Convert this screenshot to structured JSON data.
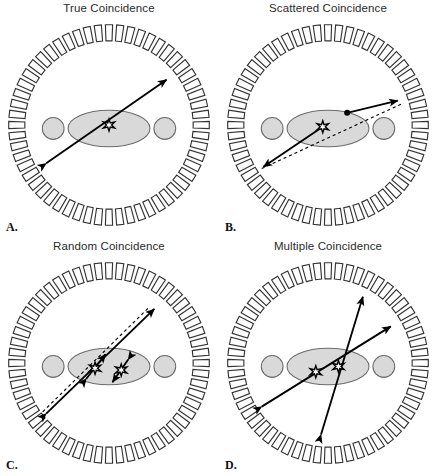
{
  "figure": {
    "caption_letters": [
      "A.",
      "B.",
      "C.",
      "D."
    ],
    "background_color": "#ffffff",
    "line_color": "#000000",
    "phantom_fill": "#d9d9d9",
    "phantom_stroke": "#6b6b6b",
    "detector_fill": "#ffffff",
    "detector_stroke": "#333333"
  },
  "panels": [
    {
      "id": "A",
      "letter": "A.",
      "title": "True Coincidence",
      "description": "Both 511 keV photons from a single annihilation travel undeviated and are detected in opposite detector blocks.",
      "events": [
        {
          "kind": "true",
          "source_star": {
            "x": 0.0,
            "y": 0.0
          },
          "lines": [
            {
              "style": "solid",
              "arrows": "both",
              "x1": -0.72,
              "y1": 0.44,
              "x2": 0.66,
              "y2": -0.52
            }
          ]
        }
      ]
    },
    {
      "id": "B",
      "letter": "B.",
      "title": "Scattered Coincidence",
      "description": "One photon undergoes Compton scatter inside the phantom; the assigned line of response (dotted) is displaced from the true annihilation site.",
      "events": [
        {
          "kind": "scattered",
          "source_star": {
            "x": -0.06,
            "y": 0.02
          },
          "scatter_point": {
            "x": 0.22,
            "y": -0.14
          },
          "lines": [
            {
              "style": "solid",
              "arrows": "end",
              "x1": -0.06,
              "y1": 0.02,
              "x2": -0.74,
              "y2": 0.48
            },
            {
              "style": "solid",
              "arrows": "end",
              "x1": 0.22,
              "y1": -0.14,
              "x2": 0.8,
              "y2": -0.28
            },
            {
              "style": "dotted",
              "arrows": "none",
              "x1": -0.76,
              "y1": 0.5,
              "x2": 0.84,
              "y2": -0.24
            }
          ]
        }
      ]
    },
    {
      "id": "C",
      "letter": "C.",
      "title": "Random Coincidence",
      "description": "Photons from two unrelated annihilations are recorded within the coincidence window; the assigned line of response (dotted) corresponds to neither true event.",
      "events": [
        {
          "kind": "random",
          "source_star": {
            "x": -0.16,
            "y": 0.06
          },
          "lines": [
            {
              "style": "solid",
              "arrows": "both",
              "x1": -0.26,
              "y1": 0.18,
              "x2": -0.04,
              "y2": -0.1
            },
            {
              "style": "solid",
              "arrows": "both",
              "x1": -0.72,
              "y1": 0.58,
              "x2": 0.52,
              "y2": -0.62
            }
          ]
        },
        {
          "kind": "random",
          "source_star": {
            "x": 0.14,
            "y": 0.08
          },
          "lines": [
            {
              "style": "solid",
              "arrows": "both",
              "x1": 0.22,
              "y1": -0.04,
              "x2": 0.04,
              "y2": 0.22
            },
            {
              "style": "dotted",
              "arrows": "none",
              "x1": -0.76,
              "y1": 0.56,
              "x2": 0.46,
              "y2": -0.64
            }
          ]
        }
      ]
    },
    {
      "id": "D",
      "letter": "D.",
      "title": "Multiple Coincidence",
      "description": "Three or more photons from two separate annihilations are detected in the same coincidence window; the event cannot be assigned to a single line of response.",
      "events": [
        {
          "kind": "multiple",
          "source_star": {
            "x": -0.14,
            "y": 0.1
          },
          "lines": [
            {
              "style": "solid",
              "arrows": "both",
              "x1": -0.76,
              "y1": 0.5,
              "x2": 0.72,
              "y2": -0.42
            }
          ]
        },
        {
          "kind": "multiple",
          "source_star": {
            "x": 0.12,
            "y": 0.04
          },
          "lines": [
            {
              "style": "solid",
              "arrows": "both",
              "x1": -0.08,
              "y1": 0.82,
              "x2": 0.4,
              "y2": -0.76
            }
          ]
        }
      ]
    }
  ],
  "scanner": {
    "detector_count": 56,
    "detector_ring_label": "detector-ring",
    "phantom": {
      "torso": {
        "cx": 0.0,
        "cy": 0.04,
        "rx": 0.47,
        "ry": 0.21
      },
      "left_arm": {
        "cx": -0.64,
        "cy": 0.04,
        "r": 0.125
      },
      "right_arm": {
        "cx": 0.64,
        "cy": 0.04,
        "r": 0.125
      }
    }
  }
}
